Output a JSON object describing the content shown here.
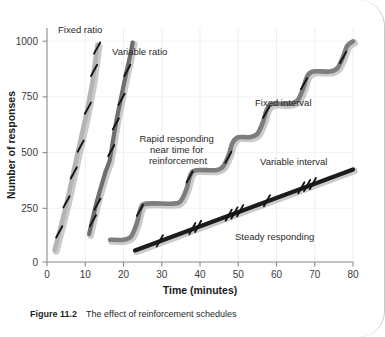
{
  "figure": {
    "caption_label": "Figure 11.2",
    "caption_text": "The effect of reinforcement schedules"
  },
  "chart_data": {
    "type": "line",
    "title": "",
    "xlabel": "Time (minutes)",
    "ylabel": "Number of responses",
    "xlim": [
      0,
      80
    ],
    "ylim": [
      0,
      1050
    ],
    "xticks": [
      0,
      10,
      20,
      30,
      40,
      50,
      60,
      70,
      80
    ],
    "yticks": [
      0,
      250,
      500,
      750,
      1000
    ],
    "grid": true,
    "grid_style": "light vertical and horizontal gridlines",
    "legend": "inline annotations, no legend box",
    "series": [
      {
        "name": "Fixed ratio",
        "color": "#b4b4b4",
        "label_x": 6,
        "label_y": 1040,
        "points": [
          [
            2,
            55
          ],
          [
            3,
            120
          ],
          [
            4.5,
            220
          ],
          [
            6,
            330
          ],
          [
            7.5,
            450
          ],
          [
            9,
            565
          ],
          [
            10.5,
            680
          ],
          [
            11.8,
            800
          ],
          [
            12.6,
            900
          ],
          [
            13.2,
            975
          ]
        ],
        "hatch_marks": [
          [
            3.2,
            135
          ],
          [
            5.1,
            270
          ],
          [
            7.0,
            400
          ],
          [
            8.8,
            520
          ],
          [
            10.7,
            690
          ],
          [
            12.3,
            860
          ],
          [
            13.1,
            960
          ]
        ]
      },
      {
        "name": "Variable ratio",
        "color": "#6e6e6e",
        "label_x": 17,
        "label_y": 930,
        "points": [
          [
            11,
            125
          ],
          [
            12,
            200
          ],
          [
            13,
            270
          ],
          [
            14,
            330
          ],
          [
            15.2,
            400
          ],
          [
            16.4,
            455
          ],
          [
            17.2,
            540
          ],
          [
            18.2,
            640
          ],
          [
            19.4,
            740
          ],
          [
            20.6,
            840
          ],
          [
            21.6,
            915
          ],
          [
            22.4,
            985
          ]
        ],
        "hatch_marks": [
          [
            12.0,
            185
          ],
          [
            13.2,
            260
          ],
          [
            16.8,
            500
          ],
          [
            18.0,
            620
          ],
          [
            19.5,
            730
          ],
          [
            21.0,
            860
          ]
        ]
      },
      {
        "name": "Fixed interval",
        "color": "#7d7d7d",
        "label_x": 55,
        "label_y": 735,
        "scalloped": true,
        "points": [
          [
            16.5,
            100
          ],
          [
            20,
            100
          ],
          [
            22,
            115
          ],
          [
            23.5,
            175
          ],
          [
            24.5,
            240
          ],
          [
            26,
            262
          ],
          [
            33,
            262
          ],
          [
            35,
            275
          ],
          [
            36.5,
            330
          ],
          [
            37.5,
            390
          ],
          [
            39,
            412
          ],
          [
            44,
            412
          ],
          [
            46,
            428
          ],
          [
            47.5,
            480
          ],
          [
            48.5,
            535
          ],
          [
            50,
            560
          ],
          [
            53,
            560
          ],
          [
            55,
            575
          ],
          [
            56.5,
            630
          ],
          [
            57.5,
            685
          ],
          [
            59,
            710
          ],
          [
            63.5,
            710
          ],
          [
            65.5,
            726
          ],
          [
            67,
            780
          ],
          [
            68,
            832
          ],
          [
            69.5,
            855
          ],
          [
            74,
            855
          ],
          [
            76,
            872
          ],
          [
            77.5,
            925
          ],
          [
            78.5,
            970
          ],
          [
            80,
            990
          ]
        ],
        "hatch_marks": [
          [
            24.3,
            232
          ],
          [
            37.3,
            382
          ],
          [
            47.4,
            470
          ],
          [
            57.3,
            672
          ],
          [
            67.2,
            800
          ],
          [
            77.4,
            918
          ]
        ]
      },
      {
        "name": "Variable interval",
        "color": "#1c1c1c",
        "label_x": 56,
        "label_y": 430,
        "points": [
          [
            23,
            52
          ],
          [
            80,
            415
          ]
        ],
        "hatch_marks": [
          [
            29.5,
            95
          ],
          [
            38.0,
            150
          ],
          [
            39.5,
            160
          ],
          [
            47.5,
            210
          ],
          [
            49.0,
            220
          ],
          [
            50.5,
            230
          ],
          [
            57.5,
            275
          ],
          [
            66.5,
            333
          ],
          [
            68.0,
            343
          ],
          [
            69.5,
            352
          ]
        ]
      }
    ],
    "annotations": [
      {
        "name": "fixed-ratio-label",
        "text": "Fixed ratio",
        "x": 6,
        "y": 1040
      },
      {
        "name": "variable-ratio-label",
        "text": "Variable ratio",
        "x": 17.5,
        "y": 935
      },
      {
        "name": "rapid-responding-label",
        "lines": [
          "Rapid responding",
          "near time for",
          "reinforcement"
        ],
        "x": 31,
        "y": 580
      },
      {
        "name": "fixed-interval-label",
        "text": "Fixed interval",
        "x": 54.5,
        "y": 740
      },
      {
        "name": "variable-interval-label",
        "text": "Variable interval",
        "x": 56,
        "y": 435
      },
      {
        "name": "steady-responding-label",
        "text": "Steady responding",
        "x": 50,
        "y": 125
      }
    ]
  }
}
